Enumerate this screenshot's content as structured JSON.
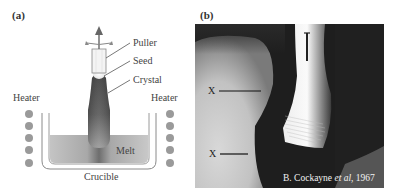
{
  "figure": {
    "panel_a": {
      "label": "(a)",
      "labels": {
        "puller": "Puller",
        "seed": "Seed",
        "crystal": "Crystal",
        "heater_left": "Heater",
        "heater_right": "Heater",
        "melt": "Melt",
        "crucible": "Crucible"
      },
      "icons": {
        "pull_direction": "arrow-up-icon",
        "rotation": "rotation-arrows-icon",
        "heater_elements": "heater-dot-icon"
      }
    },
    "panel_b": {
      "label": "(b)",
      "markers": [
        "X",
        "X"
      ],
      "scale_bar": "scale-bar",
      "credit": {
        "author": "B. Cockayne ",
        "etal": "et al",
        "year": ", 1967"
      }
    },
    "colors": {
      "text": "#333333",
      "heater_dot": "#9a9a9a",
      "melt": "#b9b9b9",
      "crystal_dark": "#555555",
      "photo_dark": "#1e1e1e"
    }
  }
}
